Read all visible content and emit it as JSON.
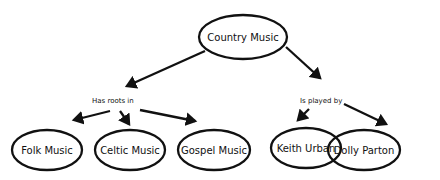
{
  "diagram": {
    "root": {
      "label": "Country Music"
    },
    "relations": [
      {
        "label": "Has roots in",
        "targets": [
          "Folk Music",
          "Celtic Music",
          "Gospel Music"
        ]
      },
      {
        "label": "Is played by",
        "targets": [
          "Keith Urban",
          "Dolly Parton"
        ]
      }
    ],
    "nodes": {
      "folk": "Folk Music",
      "celtic": "Celtic Music",
      "gospel": "Gospel Music",
      "keith": "Keith Urban",
      "dolly": "Dolly Parton"
    }
  }
}
